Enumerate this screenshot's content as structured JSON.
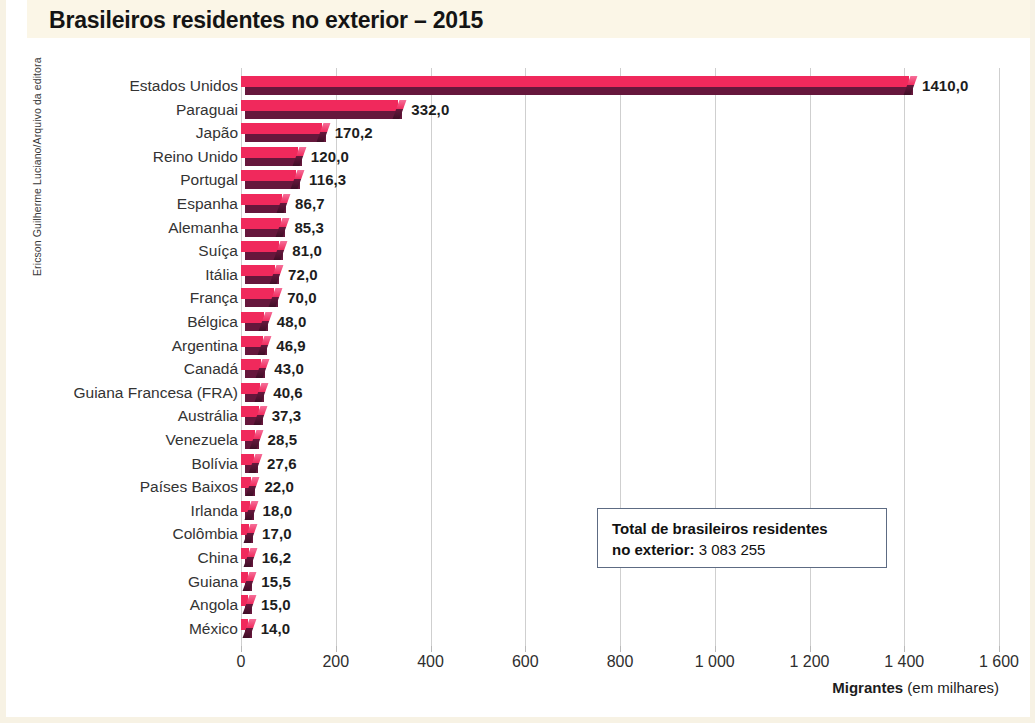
{
  "figure": {
    "title": "Brasileiros residentes no exterior – 2015",
    "credit": "Ericson Guilherme Luciano/Arquivo da editora",
    "accent_color": "#f0295c",
    "accent_shadow_color": "#66173c",
    "title_band_color": "#fbf6e7"
  },
  "total_box": {
    "line1": "Total de brasileiros residentes",
    "label2": "no exterior:",
    "value2": " 3 083 255"
  },
  "axis_caption": {
    "strong": "Migrantes",
    "rest": " (em milhares)"
  },
  "chart_data": {
    "type": "bar",
    "orientation": "horizontal",
    "title": "Brasileiros residentes no exterior – 2015",
    "xlabel": "Migrantes (em milhares)",
    "ylabel": "",
    "xlim": [
      0,
      1600
    ],
    "grid": true,
    "legend": false,
    "unit": "milhares de migrantes",
    "value_format": "pt-BR decimal comma, one decimal place",
    "xticks": [
      0,
      200,
      400,
      600,
      800,
      1000,
      1200,
      1400,
      1600
    ],
    "xtick_labels": [
      "0",
      "200",
      "400",
      "600",
      "800",
      "1 000",
      "1 200",
      "1 400",
      "1 600"
    ],
    "categories": [
      "Estados Unidos",
      "Paraguai",
      "Japão",
      "Reino Unido",
      "Portugal",
      "Espanha",
      "Alemanha",
      "Suíça",
      "Itália",
      "França",
      "Bélgica",
      "Argentina",
      "Canadá",
      "Guiana Francesa (FRA)",
      "Austrália",
      "Venezuela",
      "Bolívia",
      "Países Baixos",
      "Irlanda",
      "Colômbia",
      "China",
      "Guiana",
      "Angola",
      "México"
    ],
    "values": [
      1410.0,
      332.0,
      170.2,
      120.0,
      116.3,
      86.7,
      85.3,
      81.0,
      72.0,
      70.0,
      48.0,
      46.9,
      43.0,
      40.6,
      37.3,
      28.5,
      27.6,
      22.0,
      18.0,
      17.0,
      16.2,
      15.5,
      15.0,
      14.0
    ],
    "value_labels": [
      "1410,0",
      "332,0",
      "170,2",
      "120,0",
      "116,3",
      "86,7",
      "85,3",
      "81,0",
      "72,0",
      "70,0",
      "48,0",
      "46,9",
      "43,0",
      "40,6",
      "37,3",
      "28,5",
      "27,6",
      "22,0",
      "18,0",
      "17,0",
      "16,2",
      "15,5",
      "15,0",
      "14,0"
    ],
    "annotations": [
      "Total de brasileiros residentes no exterior: 3 083 255"
    ]
  }
}
